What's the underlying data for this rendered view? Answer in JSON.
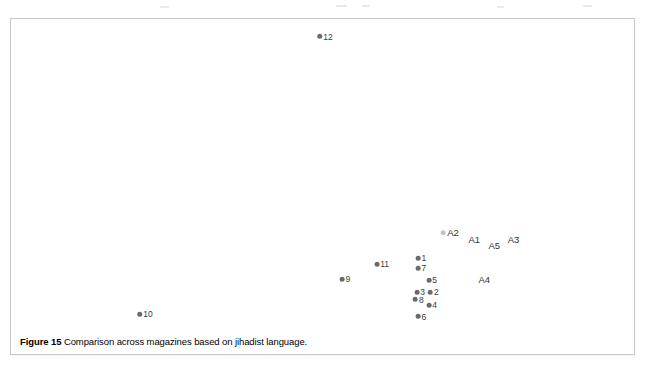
{
  "figure": {
    "caption_number": "Figure 15",
    "caption_text": "Comparison across magazines based on jihadist language.",
    "border_color": "#c6c8ca",
    "background_color": "#ffffff"
  },
  "chart_data": {
    "type": "scatter",
    "title": "Figure 15 Comparison across magazines based on jihadist language.",
    "xlabel": "",
    "ylabel": "",
    "grid": false,
    "legend": "none",
    "axes_visible": false,
    "marker_color": "#6a6a6a",
    "label_color": "#3a3a3a",
    "xlim": [
      0,
      100
    ],
    "ylim": [
      0,
      100
    ],
    "points": [
      {
        "label": "12",
        "x": 50.4,
        "y": 5.8,
        "marker": "dot",
        "kind": "magazine"
      },
      {
        "label": "A2",
        "x": 70.4,
        "y": 70.1,
        "marker": "faint",
        "kind": "aggregate"
      },
      {
        "label": "A1",
        "x": 74.2,
        "y": 72.4,
        "marker": "none",
        "kind": "aggregate"
      },
      {
        "label": "A5",
        "x": 77.4,
        "y": 74.5,
        "marker": "none",
        "kind": "aggregate"
      },
      {
        "label": "A3",
        "x": 80.5,
        "y": 72.4,
        "marker": "none",
        "kind": "aggregate"
      },
      {
        "label": "1",
        "x": 65.8,
        "y": 78.3,
        "marker": "dot",
        "kind": "magazine"
      },
      {
        "label": "7",
        "x": 65.8,
        "y": 81.8,
        "marker": "dot",
        "kind": "magazine"
      },
      {
        "label": "11",
        "x": 59.5,
        "y": 80.3,
        "marker": "dot",
        "kind": "magazine"
      },
      {
        "label": "5",
        "x": 67.5,
        "y": 85.5,
        "marker": "dot",
        "kind": "magazine"
      },
      {
        "label": "9",
        "x": 53.6,
        "y": 85.2,
        "marker": "dot",
        "kind": "magazine"
      },
      {
        "label": "A4",
        "x": 75.8,
        "y": 85.5,
        "marker": "none",
        "kind": "aggregate"
      },
      {
        "label": "3",
        "x": 65.6,
        "y": 89.6,
        "marker": "dot",
        "kind": "magazine"
      },
      {
        "label": "2",
        "x": 67.8,
        "y": 89.6,
        "marker": "dot",
        "kind": "magazine"
      },
      {
        "label": "8",
        "x": 65.4,
        "y": 92.0,
        "marker": "dot",
        "kind": "magazine"
      },
      {
        "label": "4",
        "x": 67.5,
        "y": 93.7,
        "marker": "dot",
        "kind": "magazine"
      },
      {
        "label": "6",
        "x": 65.8,
        "y": 97.6,
        "marker": "dot",
        "kind": "magazine"
      },
      {
        "label": "10",
        "x": 21.5,
        "y": 96.7,
        "marker": "dot",
        "kind": "magazine"
      }
    ]
  },
  "scan_artifacts": [
    {
      "x": 160,
      "y": 6,
      "w": 9
    },
    {
      "x": 336,
      "y": 5,
      "w": 11
    },
    {
      "x": 362,
      "y": 5,
      "w": 8
    },
    {
      "x": 497,
      "y": 6,
      "w": 7
    },
    {
      "x": 583,
      "y": 5,
      "w": 9
    }
  ]
}
